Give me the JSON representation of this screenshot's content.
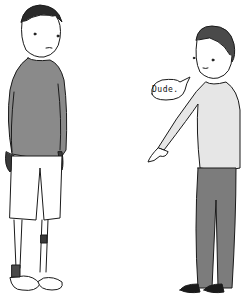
{
  "scene": {
    "description": "Cartoon of two men; the man on the right points at the other man's legs/socks",
    "speech_bubble": {
      "text": "Dude."
    },
    "colors": {
      "line": "#1a1a1a",
      "sweater_left": "#8a8a8a",
      "sweater_right": "#e6e6e6",
      "pants_right": "#7c7c7c",
      "skin": "#ffffff",
      "background": "#ffffff"
    }
  }
}
